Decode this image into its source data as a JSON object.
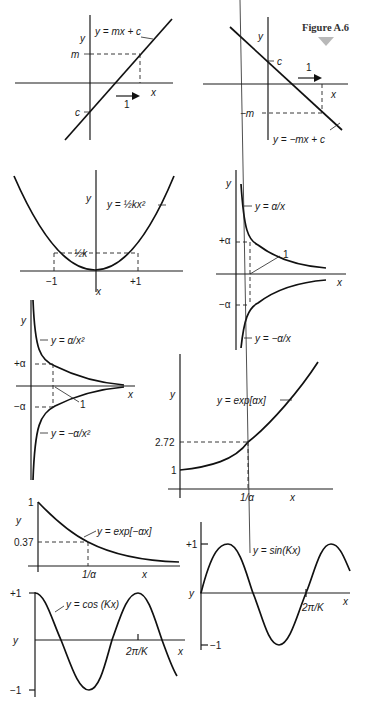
{
  "figure": {
    "title": "Figure A.6",
    "marker_color": "#b8b8b8"
  },
  "panels": {
    "linear_pos": {
      "equation": "y = mx + c",
      "y_axis": "y",
      "x_axis": "x",
      "slope_label": "m",
      "intercept_label": "c",
      "step_label": "1"
    },
    "linear_neg": {
      "equation": "y = −mx + c",
      "y_axis": "y",
      "x_axis": "x",
      "slope_label": "−m",
      "intercept_label": "c",
      "step_label": "1"
    },
    "parabola": {
      "equation": "y = ½kx²",
      "y_axis": "y",
      "x_axis": "x",
      "value_label": "½k",
      "x_neg": "−1",
      "x_pos": "+1"
    },
    "reciprocal": {
      "equation_pos": "y = α/x",
      "equation_neg": "y = −α/x",
      "y_axis": "y",
      "x_axis": "x",
      "plus_alpha": "+α",
      "minus_alpha": "−α",
      "one_label": "1"
    },
    "inverse_square": {
      "equation_pos": "y = α/x²",
      "equation_neg": "y = −α/x²",
      "y_axis": "y",
      "x_axis": "x",
      "plus_alpha": "+α",
      "minus_alpha": "−α",
      "one_label": "1"
    },
    "exp_growth": {
      "equation": "y = exp[αx]",
      "y_axis": "y",
      "x_axis": "x",
      "y_value": "2.72",
      "y_one": "1",
      "x_value": "1/α"
    },
    "exp_decay": {
      "equation": "y = exp[−αx]",
      "y_axis": "y",
      "x_axis": "x",
      "y_value": "0.37",
      "y_one": "1",
      "x_value": "1/α"
    },
    "sine": {
      "equation": "y = sin(Kx)",
      "y_axis": "y",
      "x_axis": "x",
      "y_max": "+1",
      "y_min": "−1",
      "period": "2π/K"
    },
    "cosine": {
      "equation": "y = cos (Kx)",
      "y_axis": "y",
      "x_axis": "x",
      "y_max": "+1",
      "y_min": "−1",
      "period": "2π/K"
    }
  }
}
